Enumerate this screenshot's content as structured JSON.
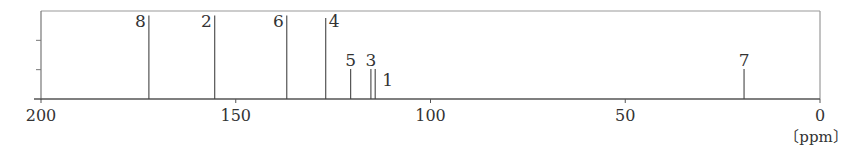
{
  "chart_data": {
    "type": "bar",
    "title": "",
    "xlabel": "[ppm]",
    "ylabel": "",
    "xlim": [
      200,
      0
    ],
    "x_reversed": true,
    "xticks": [
      200,
      150,
      100,
      50,
      0
    ],
    "xtick_labels": [
      "200",
      "150",
      "100",
      "50",
      "0"
    ],
    "yticks_count": 3,
    "grid": false,
    "legend": null,
    "peaks": [
      {
        "label": "8",
        "ppm": 172.3,
        "height": 0.95
      },
      {
        "label": "2",
        "ppm": 155.4,
        "height": 0.95
      },
      {
        "label": "6",
        "ppm": 136.9,
        "height": 0.95
      },
      {
        "label": "4",
        "ppm": 126.9,
        "height": 0.92
      },
      {
        "label": "5",
        "ppm": 120.5,
        "height": 0.34
      },
      {
        "label": "3",
        "ppm": 115.3,
        "height": 0.34
      },
      {
        "label": "1",
        "ppm": 114.2,
        "height": 0.34
      },
      {
        "label": "7",
        "ppm": 19.5,
        "height": 0.34
      }
    ]
  },
  "axis": {
    "unit_label": "〔ppm〕"
  }
}
